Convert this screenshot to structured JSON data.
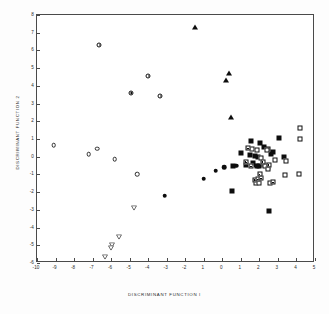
{
  "chart_data": {
    "type": "scatter",
    "title": "",
    "xlabel": "DISCRIMINANT  FUNCTION  I",
    "ylabel": "DISCRIMINANT  FUNCTION  2",
    "xlim": [
      -10,
      5
    ],
    "ylim": [
      -6,
      8
    ],
    "xticks": [
      -10,
      -9,
      -8,
      -7,
      -6,
      -5,
      -4,
      -3,
      -2,
      1,
      0,
      1,
      2,
      3,
      4,
      5
    ],
    "xtick_labels": [
      "-10",
      "-9",
      "-8",
      "-7",
      "-6",
      "-5",
      "-4",
      "-3",
      "-2",
      "1",
      "0",
      "1",
      "2",
      "3",
      "4",
      "5"
    ],
    "yticks": [
      8,
      7,
      6,
      5,
      4,
      3,
      2,
      1,
      0,
      -1,
      -2,
      -3,
      -4,
      -5,
      -6
    ],
    "ytick_labels": [
      "8",
      "7",
      "6",
      "5",
      "4",
      "3",
      "2",
      "1",
      "0",
      "-1",
      "-2",
      "-3",
      "-4",
      "-5",
      "-6"
    ],
    "grid": false,
    "legend": "none",
    "series": [
      {
        "name": "half-filled-circle",
        "marker": "circle-half",
        "points": [
          [
            -6.65,
            6.3
          ],
          [
            -4.0,
            4.55
          ],
          [
            -4.95,
            3.6
          ],
          [
            -3.35,
            3.45
          ]
        ]
      },
      {
        "name": "filled-triangle",
        "marker": "triangle-up-filled",
        "points": [
          [
            -1.5,
            7.3
          ],
          [
            0.35,
            4.7
          ],
          [
            0.2,
            4.35
          ],
          [
            0.45,
            2.25
          ]
        ]
      },
      {
        "name": "open-circle",
        "marker": "circle-open",
        "points": [
          [
            -9.1,
            0.65
          ],
          [
            -7.2,
            0.15
          ],
          [
            -6.75,
            0.45
          ],
          [
            -5.8,
            -0.15
          ],
          [
            -4.6,
            -1.0
          ]
        ]
      },
      {
        "name": "filled-circle",
        "marker": "circle-filled",
        "points": [
          [
            -3.1,
            -2.2
          ],
          [
            -1.0,
            -1.25
          ],
          [
            -0.35,
            -0.8
          ],
          [
            0.1,
            -0.6
          ],
          [
            0.75,
            -0.5
          ],
          [
            1.25,
            -0.45
          ],
          [
            1.8,
            -0.5
          ]
        ]
      },
      {
        "name": "open-down-triangle",
        "marker": "triangle-down-open",
        "points": [
          [
            -4.75,
            -2.4
          ],
          [
            -5.55,
            -4.05
          ],
          [
            -5.95,
            -4.5
          ],
          [
            -6.0,
            -4.65
          ],
          [
            -6.35,
            -5.15
          ]
        ]
      },
      {
        "name": "filled-square",
        "marker": "square-filled",
        "points": [
          [
            1.55,
            0.9
          ],
          [
            1.0,
            0.2
          ],
          [
            2.05,
            0.75
          ],
          [
            2.25,
            0.55
          ],
          [
            2.45,
            0.45
          ],
          [
            3.05,
            1.05
          ],
          [
            2.75,
            0.25
          ],
          [
            1.5,
            0.1
          ],
          [
            1.75,
            0.05
          ],
          [
            1.95,
            0.0
          ],
          [
            2.6,
            0.15
          ],
          [
            3.35,
            0.0
          ],
          [
            1.25,
            -0.45
          ],
          [
            1.65,
            -0.35
          ],
          [
            1.85,
            -0.55
          ],
          [
            2.0,
            -0.55
          ],
          [
            2.25,
            -0.45
          ],
          [
            2.45,
            -0.6
          ],
          [
            0.55,
            -0.5
          ],
          [
            0.5,
            -1.95
          ],
          [
            2.5,
            -3.05
          ],
          [
            1.95,
            -1.35
          ]
        ]
      },
      {
        "name": "open-square",
        "marker": "square-open",
        "points": [
          [
            4.2,
            1.6
          ],
          [
            4.2,
            1.0
          ],
          [
            1.6,
            0.45
          ],
          [
            1.85,
            0.4
          ],
          [
            2.4,
            0.4
          ],
          [
            2.1,
            -0.1
          ],
          [
            2.85,
            -0.2
          ],
          [
            3.45,
            -0.25
          ],
          [
            2.3,
            -0.55
          ],
          [
            2.45,
            -0.7
          ],
          [
            3.4,
            -1.05
          ],
          [
            4.15,
            -1.0
          ],
          [
            1.8,
            -1.5
          ],
          [
            2.0,
            -1.5
          ],
          [
            2.55,
            -1.5
          ]
        ]
      },
      {
        "name": "half-filled-square",
        "marker": "square-half",
        "points": [
          [
            1.4,
            0.5
          ],
          [
            1.3,
            -0.3
          ],
          [
            1.55,
            -0.55
          ],
          [
            2.2,
            -0.3
          ],
          [
            2.5,
            -0.45
          ],
          [
            1.75,
            -1.3
          ],
          [
            1.9,
            -1.25
          ],
          [
            2.1,
            -1.2
          ],
          [
            2.75,
            -1.45
          ],
          [
            2.05,
            -0.95
          ]
        ]
      }
    ]
  }
}
